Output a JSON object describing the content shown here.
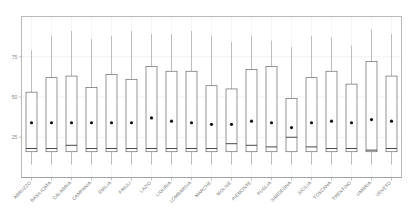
{
  "chart_data": {
    "type": "box",
    "title": "",
    "xlabel": "",
    "ylabel": "",
    "ylim": [
      0,
      100
    ],
    "grid": true,
    "legend": null,
    "yticks": [
      25,
      50,
      75
    ],
    "ytick_labels": [
      "25",
      "50",
      "75"
    ],
    "categories": [
      "ABRUZZO",
      "BASILICATA",
      "CALABRIA",
      "CAMPANIA",
      "EMILIA",
      "FRIULI",
      "LAZIO",
      "LIGURIA",
      "LOMBARDIA",
      "MARCHE",
      "MOLISE",
      "PIEMONTE",
      "PUGLIA",
      "SARDEGNA",
      "SICILIA",
      "TOSCANA",
      "TRENTINO",
      "UMBRIA",
      "VENETO"
    ],
    "boxes": [
      {
        "name": "ABRUZZO",
        "whisker_low": 8,
        "q1": 16,
        "median": 18,
        "q3": 53,
        "whisker_high": 79,
        "mean": 34
      },
      {
        "name": "BASILICATA",
        "whisker_low": 8,
        "q1": 16,
        "median": 18,
        "q3": 62,
        "whisker_high": 88,
        "mean": 34
      },
      {
        "name": "CALABRIA",
        "whisker_low": 8,
        "q1": 16,
        "median": 20,
        "q3": 63,
        "whisker_high": 91,
        "mean": 34
      },
      {
        "name": "CAMPANIA",
        "whisker_low": 8,
        "q1": 16,
        "median": 18,
        "q3": 56,
        "whisker_high": 86,
        "mean": 34
      },
      {
        "name": "EMILIA",
        "whisker_low": 8,
        "q1": 16,
        "median": 18,
        "q3": 64,
        "whisker_high": 88,
        "mean": 34
      },
      {
        "name": "FRIULI",
        "whisker_low": 8,
        "q1": 16,
        "median": 18,
        "q3": 61,
        "whisker_high": 91,
        "mean": 34
      },
      {
        "name": "LAZIO",
        "whisker_low": 8,
        "q1": 16,
        "median": 18,
        "q3": 69,
        "whisker_high": 89,
        "mean": 37
      },
      {
        "name": "LIGURIA",
        "whisker_low": 8,
        "q1": 16,
        "median": 18,
        "q3": 66,
        "whisker_high": 89,
        "mean": 35
      },
      {
        "name": "LOMBARDIA",
        "whisker_low": 8,
        "q1": 16,
        "median": 18,
        "q3": 66,
        "whisker_high": 91,
        "mean": 34
      },
      {
        "name": "MARCHE",
        "whisker_low": 8,
        "q1": 16,
        "median": 18,
        "q3": 57,
        "whisker_high": 88,
        "mean": 33
      },
      {
        "name": "MOLISE",
        "whisker_low": 8,
        "q1": 16,
        "median": 21,
        "q3": 55,
        "whisker_high": 84,
        "mean": 33
      },
      {
        "name": "PIEMONTE",
        "whisker_low": 8,
        "q1": 16,
        "median": 20,
        "q3": 67,
        "whisker_high": 88,
        "mean": 35
      },
      {
        "name": "PUGLIA",
        "whisker_low": 8,
        "q1": 16,
        "median": 19,
        "q3": 69,
        "whisker_high": 85,
        "mean": 34
      },
      {
        "name": "SARDEGNA",
        "whisker_low": 8,
        "q1": 16,
        "median": 25,
        "q3": 49,
        "whisker_high": 81,
        "mean": 31
      },
      {
        "name": "SICILIA",
        "whisker_low": 8,
        "q1": 16,
        "median": 19,
        "q3": 62,
        "whisker_high": 88,
        "mean": 34
      },
      {
        "name": "TOSCANA",
        "whisker_low": 8,
        "q1": 16,
        "median": 18,
        "q3": 66,
        "whisker_high": 87,
        "mean": 35
      },
      {
        "name": "TRENTINO",
        "whisker_low": 8,
        "q1": 16,
        "median": 18,
        "q3": 58,
        "whisker_high": 82,
        "mean": 34
      },
      {
        "name": "UMBRIA",
        "whisker_low": 8,
        "q1": 16,
        "median": 17,
        "q3": 72,
        "whisker_high": 92,
        "mean": 36
      },
      {
        "name": "VENETO",
        "whisker_low": 8,
        "q1": 16,
        "median": 18,
        "q3": 63,
        "whisker_high": 89,
        "mean": 35
      }
    ]
  }
}
